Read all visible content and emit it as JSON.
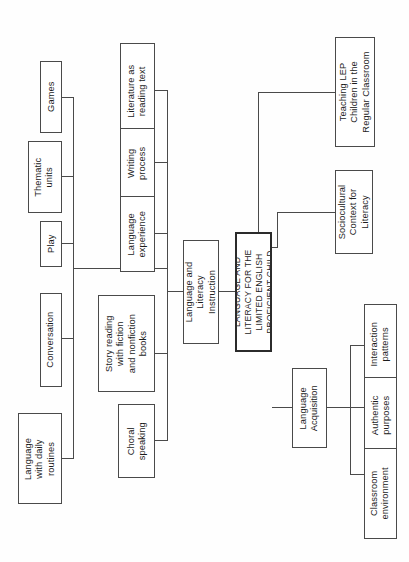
{
  "diagram": {
    "title": "LANGUAGE AND LITERACY FOR THE LIMITED ENGLISH PROFICIENT CHILD",
    "type": "tree-diagram",
    "orientation": "rotated-90-counterclockwise",
    "colors": {
      "background": "#fefefe",
      "box_border": "#4a4a4a",
      "root_border": "#2b2b2b",
      "text": "#1c1c1c",
      "line": "#4a4a4a"
    },
    "root": {
      "label": "LANGUAGE AND\nLITERACY FOR THE\nLIMITED ENGLISH\nPROFICIENT CHILD"
    },
    "branches": {
      "language_literacy_instruction": {
        "label": "Language and\nLiteracy\nInstruction"
      },
      "language_acquisition": {
        "label": "Language\nAcquisition"
      },
      "sociocultural": {
        "label": "Sociocultural\nContext for\nLiteracy"
      },
      "teaching_lep": {
        "label": "Teaching LEP\nChildren in the\nRegular Classroom"
      }
    },
    "instruction_children": [
      {
        "key": "literature",
        "label": "Literature as\nreading text"
      },
      {
        "key": "writing-process",
        "label": "Writing\nprocess"
      },
      {
        "key": "language-experience",
        "label": "Language\nexperience"
      },
      {
        "key": "story-reading",
        "label": "Story reading\nwith fiction\nand nonfiction\nbooks"
      },
      {
        "key": "choral-speaking",
        "label": "Choral\nspeaking"
      }
    ],
    "oral_language_children": [
      {
        "key": "games",
        "label": "Games"
      },
      {
        "key": "thematic-units",
        "label": "Thematic\nunits"
      },
      {
        "key": "play",
        "label": "Play"
      },
      {
        "key": "conversation",
        "label": "Conversation"
      },
      {
        "key": "daily-routines",
        "label": "Language\nwith daily\nroutines"
      }
    ],
    "acquisition_children": [
      {
        "key": "interaction-patterns",
        "label": "Interaction\npatterns"
      },
      {
        "key": "authentic-purposes",
        "label": "Authentic\npurposes"
      },
      {
        "key": "classroom-environment",
        "label": "Classroom\nenvironment"
      }
    ]
  }
}
